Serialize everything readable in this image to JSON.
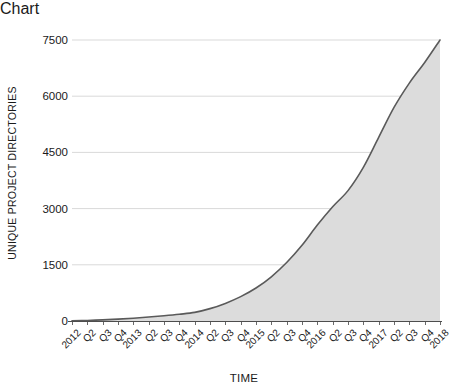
{
  "chart_data": {
    "type": "area",
    "title": "",
    "subtitle": "",
    "xlabel": "TIME",
    "ylabel": "UNIQUE PROJECT DIRECTORIES",
    "ylim": [
      0,
      7500
    ],
    "yticks": [
      0,
      1500,
      3000,
      4500,
      6000,
      7500
    ],
    "ytick_labels": [
      "0",
      "1500",
      "3000",
      "4500",
      "6000",
      "7500"
    ],
    "grid": true,
    "grid_axis": "y",
    "legend": false,
    "legend_position": "none",
    "categories": [
      "2012",
      "Q2",
      "Q3",
      "Q4",
      "2013",
      "Q2",
      "Q3",
      "Q4",
      "2014",
      "Q2",
      "Q3",
      "Q4",
      "2015",
      "Q2",
      "Q3",
      "Q4",
      "2016",
      "Q2",
      "Q3",
      "Q4",
      "2017",
      "Q2",
      "Q3",
      "Q4",
      "2018"
    ],
    "values": [
      5,
      15,
      30,
      50,
      75,
      105,
      140,
      180,
      230,
      330,
      470,
      650,
      880,
      1180,
      1560,
      2020,
      2560,
      3050,
      3480,
      4100,
      4900,
      5700,
      6350,
      6900,
      7500
    ],
    "series": [
      {
        "name": "Unique project directories",
        "values": [
          5,
          15,
          30,
          50,
          75,
          105,
          140,
          180,
          230,
          330,
          470,
          650,
          880,
          1180,
          1560,
          2020,
          2560,
          3050,
          3480,
          4100,
          4900,
          5700,
          6350,
          6900,
          7500
        ]
      }
    ],
    "colors": {
      "line": "#5a5a5a",
      "fill": "#dcdcdc",
      "grid": "#d9d9d9",
      "axis": "#4d4d4d",
      "background": "#ffffff",
      "text": "#1a1a1a"
    },
    "annotations": []
  }
}
